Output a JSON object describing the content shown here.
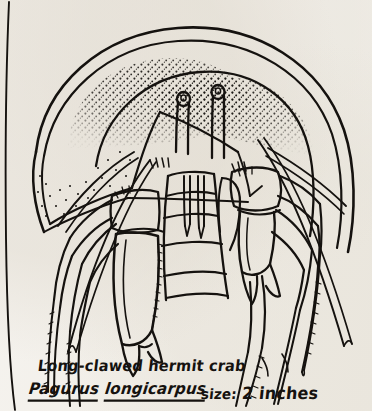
{
  "page": {
    "background_color": "#f4f2ee",
    "ink_color": "#15120f",
    "medium": "pen-and-ink line drawing on scanned book page"
  },
  "illustration": {
    "subject": "Long-clawed hermit crab emerging from a spiral snail shell",
    "view": "frontal",
    "parts": [
      "spiral gastropod shell with stippled shading",
      "two stalked eyes",
      "two long antennae",
      "enlarged right cheliped (long claw)",
      "smaller left cheliped",
      "four walking legs with spiny dactyls",
      "segmented mouthparts"
    ]
  },
  "caption": {
    "common_name": "Long-clawed hermit crab",
    "genus": "Pagurus",
    "species": "longicarpus",
    "size_label": "size:",
    "size_value": "2 inches"
  }
}
